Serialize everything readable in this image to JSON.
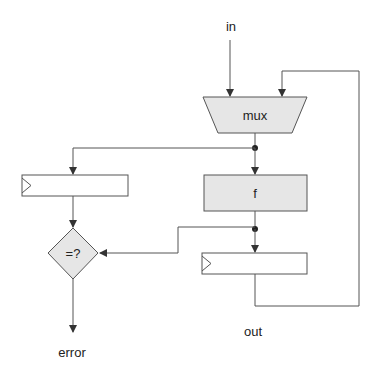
{
  "diagram": {
    "labels": {
      "input": "in",
      "output": "out",
      "error": "error"
    },
    "blocks": {
      "mux": "mux",
      "function": "f",
      "comparator": "=?"
    },
    "colors": {
      "stroke": "#555555",
      "block_fill": "#e6e6e6",
      "register_fill": "#ffffff",
      "background": "#ffffff"
    }
  }
}
